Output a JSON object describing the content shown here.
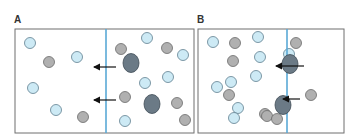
{
  "panels": [
    {
      "id": "A",
      "label": "A",
      "box": {
        "x": 15,
        "y": 29,
        "w": 179,
        "h": 104
      },
      "membrane_x": 106,
      "arrows": [
        {
          "x1": 116,
          "y1": 67,
          "x2": 94,
          "y2": 67
        },
        {
          "x1": 116,
          "y1": 100,
          "x2": 94,
          "y2": 100
        }
      ],
      "particles": [
        {
          "type": "small-light",
          "x": 30,
          "y": 43
        },
        {
          "type": "small-gray",
          "x": 49,
          "y": 62
        },
        {
          "type": "small-light",
          "x": 77,
          "y": 57
        },
        {
          "type": "small-light",
          "x": 33,
          "y": 88
        },
        {
          "type": "small-light",
          "x": 56,
          "y": 110
        },
        {
          "type": "small-gray",
          "x": 83,
          "y": 117
        },
        {
          "type": "small-gray",
          "x": 121,
          "y": 49
        },
        {
          "type": "large-dark",
          "x": 131,
          "y": 63
        },
        {
          "type": "small-light",
          "x": 147,
          "y": 38
        },
        {
          "type": "small-gray",
          "x": 167,
          "y": 48
        },
        {
          "type": "small-light",
          "x": 183,
          "y": 55
        },
        {
          "type": "small-light",
          "x": 168,
          "y": 77
        },
        {
          "type": "small-light",
          "x": 145,
          "y": 83
        },
        {
          "type": "small-gray",
          "x": 125,
          "y": 97
        },
        {
          "type": "large-dark",
          "x": 152,
          "y": 104
        },
        {
          "type": "small-gray",
          "x": 177,
          "y": 103
        },
        {
          "type": "small-light",
          "x": 125,
          "y": 121
        },
        {
          "type": "small-gray",
          "x": 185,
          "y": 120
        }
      ]
    },
    {
      "id": "B",
      "label": "B",
      "box": {
        "x": 198,
        "y": 29,
        "w": 146,
        "h": 104
      },
      "membrane_x": 287,
      "arrows": [
        {
          "x1": 304,
          "y1": 66,
          "x2": 276,
          "y2": 66
        },
        {
          "x1": 300,
          "y1": 99,
          "x2": 283,
          "y2": 99
        }
      ],
      "particles": [
        {
          "type": "small-light",
          "x": 213,
          "y": 42
        },
        {
          "type": "small-gray",
          "x": 235,
          "y": 43
        },
        {
          "type": "small-light",
          "x": 258,
          "y": 37
        },
        {
          "type": "small-gray",
          "x": 233,
          "y": 61
        },
        {
          "type": "small-light",
          "x": 260,
          "y": 57
        },
        {
          "type": "small-light",
          "x": 256,
          "y": 76
        },
        {
          "type": "small-light",
          "x": 231,
          "y": 82
        },
        {
          "type": "small-light",
          "x": 217,
          "y": 87
        },
        {
          "type": "small-gray",
          "x": 229,
          "y": 95
        },
        {
          "type": "small-light",
          "x": 238,
          "y": 108
        },
        {
          "type": "small-light",
          "x": 234,
          "y": 118
        },
        {
          "type": "small-gray",
          "x": 265,
          "y": 114
        },
        {
          "type": "small-gray",
          "x": 267,
          "y": 116
        },
        {
          "type": "small-gray",
          "x": 277,
          "y": 119
        },
        {
          "type": "small-gray",
          "x": 296,
          "y": 43
        },
        {
          "type": "small-light",
          "x": 289,
          "y": 54
        },
        {
          "type": "large-dark",
          "x": 290,
          "y": 64
        },
        {
          "type": "small-gray",
          "x": 311,
          "y": 95
        },
        {
          "type": "large-dark",
          "x": 283,
          "y": 105
        }
      ]
    }
  ],
  "colors": {
    "border": "#6f6f6f",
    "membrane": "#5aa9d6",
    "small_light_fill": "#cdeaf5",
    "small_light_stroke": "#5f7f8f",
    "small_gray_fill": "#b0b0b0",
    "small_gray_stroke": "#6a6a6a",
    "large_dark_fill": "#6b7a86",
    "large_dark_stroke": "#3e4a54",
    "arrow": "#111111"
  }
}
